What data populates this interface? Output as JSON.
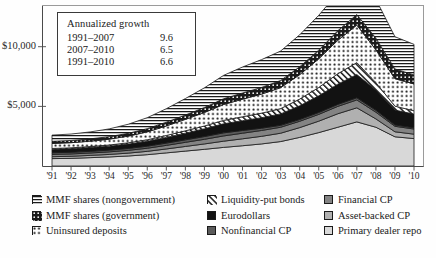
{
  "chart_data": {
    "type": "area",
    "stacked": true,
    "title": "",
    "xlabel": "",
    "ylabel": "",
    "ylim": [
      0,
      13500
    ],
    "yticks": [
      5000,
      10000
    ],
    "ytick_labels": [
      "$5,000",
      "$10,000"
    ],
    "grid": false,
    "legend_position": "below",
    "x": [
      1991,
      1992,
      1993,
      1994,
      1995,
      1996,
      1997,
      1998,
      1999,
      2000,
      2001,
      2002,
      2003,
      2004,
      2005,
      2006,
      2007,
      2008,
      2009,
      2010
    ],
    "xtick_labels": [
      "'91",
      "'92",
      "'93",
      "'94",
      "'95",
      "'96",
      "'97",
      "'98",
      "'99",
      "'00",
      "'01",
      "'02",
      "'03",
      "'04",
      "'05",
      "'06",
      "'07",
      "'08",
      "'09",
      "'10"
    ],
    "series": [
      {
        "name": "Primary dealer repo",
        "pattern": "solid-light-gray",
        "color": "#d8d8d8",
        "values": [
          620,
          640,
          700,
          760,
          840,
          950,
          1100,
          1250,
          1400,
          1560,
          1700,
          1850,
          2050,
          2400,
          2800,
          3250,
          3700,
          3250,
          2450,
          2300
        ]
      },
      {
        "name": "Asset-backed CP",
        "pattern": "solid-mid-gray",
        "color": "#b0b0b0",
        "values": [
          160,
          175,
          190,
          210,
          240,
          280,
          330,
          390,
          450,
          520,
          580,
          640,
          700,
          820,
          960,
          1130,
          1180,
          700,
          420,
          370
        ]
      },
      {
        "name": "Financial CP",
        "pattern": "solid-dark-gray",
        "color": "#838383",
        "values": [
          190,
          195,
          200,
          215,
          235,
          260,
          300,
          345,
          390,
          440,
          470,
          490,
          500,
          530,
          570,
          620,
          660,
          560,
          460,
          430
        ]
      },
      {
        "name": "Nonfinancial CP",
        "pattern": "solid-darker-gray",
        "color": "#5a5a5a",
        "values": [
          140,
          140,
          140,
          145,
          155,
          170,
          190,
          210,
          230,
          260,
          230,
          190,
          160,
          150,
          155,
          165,
          180,
          160,
          110,
          100
        ]
      },
      {
        "name": "Eurodollars",
        "pattern": "solid-black",
        "color": "#121212",
        "values": [
          290,
          300,
          315,
          335,
          365,
          410,
          480,
          560,
          650,
          760,
          820,
          880,
          960,
          1150,
          1400,
          1700,
          1950,
          1700,
          1250,
          1150
        ]
      },
      {
        "name": "Liquidity-put bonds",
        "pattern": "diagonal-hatch",
        "color": "#ffffff",
        "values": [
          70,
          75,
          85,
          95,
          110,
          130,
          160,
          195,
          235,
          285,
          330,
          380,
          440,
          560,
          700,
          870,
          1000,
          620,
          330,
          280
        ]
      },
      {
        "name": "Uninsured deposits",
        "pattern": "dots",
        "color": "#ffffff",
        "values": [
          420,
          430,
          450,
          490,
          560,
          660,
          800,
          960,
          1130,
          1330,
          1470,
          1600,
          1760,
          2050,
          2400,
          2800,
          3150,
          2750,
          2300,
          2250
        ]
      },
      {
        "name": "MMF shares (government)",
        "pattern": "black-dots",
        "color": "#1a1a1a",
        "values": [
          180,
          185,
          195,
          210,
          235,
          270,
          315,
          365,
          420,
          480,
          520,
          560,
          600,
          660,
          730,
          810,
          880,
          980,
          820,
          760
        ]
      },
      {
        "name": "MMF shares (nongovernment)",
        "pattern": "horizontal-lines",
        "color": "#ffffff",
        "values": [
          520,
          540,
          580,
          650,
          760,
          920,
          1130,
          1380,
          1650,
          1960,
          2180,
          2330,
          2470,
          2680,
          2920,
          3180,
          3420,
          3260,
          2700,
          2560
        ]
      }
    ]
  },
  "annotation": {
    "title": "Annualized growth",
    "rows": [
      {
        "period": "1991–2007",
        "value": "9.6"
      },
      {
        "period": "2007–2010",
        "value": "6.5"
      },
      {
        "period": "1991–2010",
        "value": "6.6"
      }
    ]
  },
  "legend": {
    "columns": [
      {
        "items": [
          {
            "label": "MMF shares (nongovernment)",
            "pattern": "horizontal-lines"
          },
          {
            "label": "MMF shares (government)",
            "pattern": "black-dots"
          },
          {
            "label": "Uninsured deposits",
            "pattern": "dots"
          }
        ]
      },
      {
        "items": [
          {
            "label": "Liquidity-put bonds",
            "pattern": "diagonal-hatch"
          },
          {
            "label": "Eurodollars",
            "pattern": "solid-black"
          },
          {
            "label": "Nonfinancial CP",
            "pattern": "solid-darker-gray"
          }
        ]
      },
      {
        "items": [
          {
            "label": "Financial CP",
            "pattern": "solid-dark-gray"
          },
          {
            "label": "Asset-backed CP",
            "pattern": "solid-mid-gray"
          },
          {
            "label": "Primary dealer repo",
            "pattern": "solid-light-gray"
          }
        ]
      }
    ]
  }
}
